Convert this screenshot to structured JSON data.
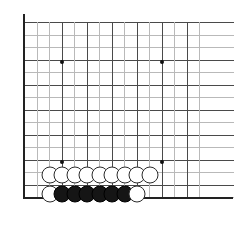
{
  "figure": {
    "kind": "go-board-diagram",
    "width": 236,
    "height": 229,
    "background_color": "#ffffff"
  },
  "board": {
    "grid_spacing": 12.5,
    "origin_x": 24,
    "origin_y": 22,
    "columns": 15,
    "rows": 15,
    "line_color": "#b9b9b9",
    "dark_line_color": "#4a4a4a",
    "edge_color": "#222222",
    "edges_shown": [
      "left",
      "bottom"
    ],
    "dark_column_indices": [
      0,
      3,
      5,
      7,
      9,
      11,
      13
    ],
    "dark_row_indices": [
      0,
      3,
      5,
      7,
      9,
      11,
      13
    ],
    "star_point_color": "#111111",
    "star_points": [
      {
        "name": "star-point-upper-left",
        "col": 3,
        "row": 3,
        "x": 62,
        "y": 62
      },
      {
        "name": "star-point-upper-right",
        "col": 11,
        "row": 3,
        "x": 162,
        "y": 62
      },
      {
        "name": "star-point-lower-left",
        "col": 3,
        "row": 11,
        "x": 62,
        "y": 162
      },
      {
        "name": "star-point-lower-right",
        "col": 11,
        "row": 11,
        "x": 162,
        "y": 162
      }
    ]
  },
  "stones": {
    "white_color": "#ffffff",
    "black_color": "#151515",
    "outline_color": "#2a2a2a",
    "diameter": 17,
    "white_count": 10,
    "black_count": 6,
    "total_count": 16,
    "items": [
      {
        "name": "stone-white-r12-c2",
        "color": "white",
        "col": 2,
        "row": 12,
        "x": 50,
        "y": 175
      },
      {
        "name": "stone-white-r12-c3",
        "color": "white",
        "col": 3,
        "row": 12,
        "x": 62,
        "y": 175
      },
      {
        "name": "stone-white-r12-c4",
        "color": "white",
        "col": 4,
        "row": 12,
        "x": 75,
        "y": 175
      },
      {
        "name": "stone-white-r12-c5",
        "color": "white",
        "col": 5,
        "row": 12,
        "x": 87,
        "y": 175
      },
      {
        "name": "stone-white-r12-c6",
        "color": "white",
        "col": 6,
        "row": 12,
        "x": 100,
        "y": 175
      },
      {
        "name": "stone-white-r12-c7",
        "color": "white",
        "col": 7,
        "row": 12,
        "x": 112,
        "y": 175
      },
      {
        "name": "stone-white-r12-c8",
        "color": "white",
        "col": 8,
        "row": 12,
        "x": 125,
        "y": 175
      },
      {
        "name": "stone-white-r12-c9",
        "color": "white",
        "col": 9,
        "row": 12,
        "x": 137,
        "y": 175
      },
      {
        "name": "stone-white-r12-c10",
        "color": "white",
        "col": 10,
        "row": 12,
        "x": 150,
        "y": 175
      },
      {
        "name": "stone-white-r13-c2",
        "color": "white",
        "col": 2,
        "row": 13,
        "x": 50,
        "y": 194
      },
      {
        "name": "stone-black-r13-c3",
        "color": "black",
        "col": 3,
        "row": 13,
        "x": 62,
        "y": 194
      },
      {
        "name": "stone-black-r13-c4",
        "color": "black",
        "col": 4,
        "row": 13,
        "x": 75,
        "y": 194
      },
      {
        "name": "stone-black-r13-c5",
        "color": "black",
        "col": 5,
        "row": 13,
        "x": 87,
        "y": 194
      },
      {
        "name": "stone-black-r13-c6",
        "color": "black",
        "col": 6,
        "row": 13,
        "x": 100,
        "y": 194
      },
      {
        "name": "stone-black-r13-c7",
        "color": "black",
        "col": 7,
        "row": 13,
        "x": 112,
        "y": 194
      },
      {
        "name": "stone-black-r13-c8",
        "color": "black",
        "col": 8,
        "row": 13,
        "x": 125,
        "y": 194
      },
      {
        "name": "stone-white-r13-c9",
        "color": "white",
        "col": 9,
        "row": 13,
        "x": 137,
        "y": 194
      }
    ]
  }
}
